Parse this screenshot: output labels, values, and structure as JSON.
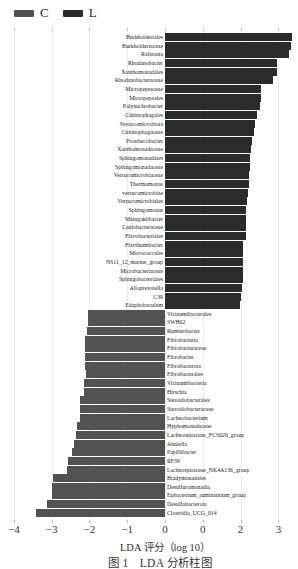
{
  "legend": [
    {
      "label": "C",
      "color": "#525252"
    },
    {
      "label": "L",
      "color": "#2b2b2b"
    }
  ],
  "axis": {
    "ticks": [
      {
        "value": -4,
        "label": "−4"
      },
      {
        "value": -3,
        "label": "−3"
      },
      {
        "value": -2,
        "label": "−2"
      },
      {
        "value": -1,
        "label": "−1"
      },
      {
        "value": 0,
        "label": "0"
      },
      {
        "value": 1,
        "label": "0"
      },
      {
        "value": 2,
        "label": "2"
      },
      {
        "value": 3,
        "label": "3"
      }
    ],
    "xlabel": "LDA 评分（log 10）"
  },
  "caption": "图 1　LDA 分析柱图",
  "chart_data": {
    "type": "bar",
    "orientation": "horizontal",
    "title": "",
    "caption": "图 1  LDA 分析柱图",
    "xlabel": "LDA 评分（log 10）",
    "ylabel": "",
    "xlim": [
      -4,
      3.4
    ],
    "xticks": [
      -4,
      -3,
      -2,
      -1,
      0,
      1,
      2,
      3
    ],
    "xtick_labels": [
      "−4",
      "−3",
      "−2",
      "−1",
      "0",
      "0",
      "2",
      "3"
    ],
    "grid": true,
    "legend": {
      "position": "top-left",
      "entries": [
        "C",
        "L"
      ]
    },
    "series": [
      {
        "name": "L",
        "color": "#2b2b2b",
        "categories": [
          "Burkholderiales",
          "Burkholderiaceae",
          "Ralstonia",
          "Rhodanobacter",
          "Xanthomonadales",
          "Rhodanobacteraceae",
          "Micropepsaceae",
          "Micropepsales",
          "Polynucleobacter",
          "Chitinophagales",
          "Verrucomicrobiota",
          "Chitinophagaceae",
          "Prosthecobacter",
          "Xanthomonadaceae",
          "Sphingomonadales",
          "Sphingomonadaceae",
          "Verrucomicrobiaceae",
          "Thermomonas",
          "verrucomicrobiae",
          "Verrucomicrobiales",
          "Sphingomonas",
          "Mizugakiibacter",
          "Caulobacteraceae",
          "Flavobacteriales",
          "Flavihumibacter",
          "Micrococcales",
          "NS11_12_marine_group",
          "Microbacteriaceae",
          "Sphingobacteriales",
          "Alloprevotella",
          "C39",
          "Edaphobaculum"
        ],
        "values": [
          3.36,
          3.33,
          3.28,
          2.96,
          2.96,
          2.86,
          2.54,
          2.54,
          2.51,
          2.43,
          2.38,
          2.35,
          2.3,
          2.28,
          2.25,
          2.25,
          2.22,
          2.22,
          2.2,
          2.17,
          2.14,
          2.14,
          2.14,
          2.14,
          2.06,
          2.06,
          2.06,
          2.06,
          2.06,
          2.04,
          2.01,
          1.98
        ]
      },
      {
        "name": "C",
        "color": "#525252",
        "categories": [
          "Vicinamibacterales",
          "SWB02",
          "Ruminobacter",
          "Fibrobacteria",
          "Fibrobacteraceae",
          "Fibrobacter",
          "Fibrobacterota",
          "Fibrobacterales",
          "Vicinamibacteria",
          "Hirschia",
          "Steroidobacterales",
          "Steroidobacteraceae",
          "Lachnobacterium",
          "Hyphomonadaceae",
          "Lachnospiraceae_FCS020_group",
          "Ahniella",
          "Papillibacter",
          "RF39",
          "Lachnospiraceae_NK4A136_group",
          "Bradymonadales",
          "Desulfuromonadia",
          "Eubacterium_ruminantium_group",
          "Desulfobacterota",
          "Clostridia_UCG_014"
        ],
        "values": [
          -2.04,
          -2.04,
          -2.06,
          -2.12,
          -2.12,
          -2.12,
          -2.12,
          -2.1,
          -2.14,
          -2.14,
          -2.25,
          -2.25,
          -2.25,
          -2.33,
          -2.35,
          -2.4,
          -2.46,
          -2.56,
          -2.59,
          -2.96,
          -2.99,
          -2.99,
          -3.12,
          -3.41
        ]
      }
    ]
  }
}
